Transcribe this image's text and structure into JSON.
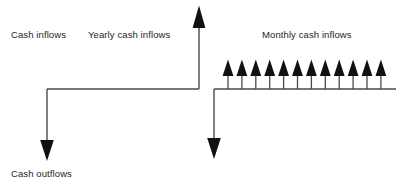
{
  "diagram": {
    "type": "cash-flow-timeline-diagram",
    "background_color": "#ffffff",
    "stroke_color": "#231f20",
    "text_color": "#231f20",
    "labels": {
      "cash_inflows": "Cash inflows",
      "yearly_cash_inflows": "Yearly cash inflows",
      "monthly_cash_inflows": "Monthly cash inflows",
      "cash_outflows": "Cash outflows"
    },
    "axes": {
      "left_timeline": {
        "x_start": 47,
        "x_end": 199,
        "y": 89
      },
      "right_timeline": {
        "x_start": 214,
        "x_end": 396,
        "y": 89
      }
    },
    "arrows": {
      "yearly_inflow": {
        "direction": "up",
        "x": 199,
        "y_base": 89,
        "y_tip": 6,
        "count": 1
      },
      "monthly_inflows": {
        "direction": "up",
        "count": 12,
        "x_first": 228,
        "x_last": 381,
        "y_base": 89,
        "y_tip": 60
      },
      "left_outflow": {
        "direction": "down",
        "x": 47,
        "y_base": 89,
        "y_tip": 160,
        "count": 1
      },
      "right_outflow": {
        "direction": "down",
        "x": 214,
        "y_base": 89,
        "y_tip": 158,
        "count": 1
      }
    }
  }
}
